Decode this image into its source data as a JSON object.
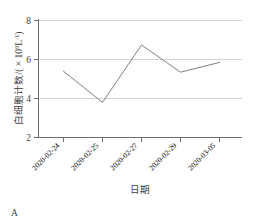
{
  "panel": {
    "label": "A"
  },
  "chart_data": {
    "type": "line",
    "title": "",
    "subtitle": "",
    "xlabel": "日期",
    "ylabel_main": "白细胞计数/( × 10",
    "ylabel_exp": "9",
    "ylabel_unit": "L",
    "ylabel_unit_exp": "-1",
    "ylabel_close": ")",
    "ylabel_full": "白细胞计数/( × 10⁹L⁻¹)",
    "categories": [
      "2020-02-24",
      "2020-02-25",
      "2020-02-27",
      "2020-02-29",
      "2020-03-05"
    ],
    "values": [
      5.4,
      3.8,
      6.75,
      5.35,
      5.85
    ],
    "series": [
      {
        "name": "白细胞计数",
        "values": [
          5.4,
          3.8,
          6.75,
          5.35,
          5.85
        ],
        "color": "#808080"
      }
    ],
    "ylim": [
      2,
      8
    ],
    "yticks": [
      2,
      4,
      6,
      8
    ],
    "ytick_labels": [
      "2",
      "4",
      "6",
      "8"
    ],
    "gridlines_y": [
      4,
      6,
      8
    ],
    "grid": true,
    "grid_color": "#d6d6d6",
    "axis_color": "#6e6e6e",
    "line_color": "#808080",
    "legend": "none",
    "xtick_rotation": -45,
    "markers": false
  }
}
